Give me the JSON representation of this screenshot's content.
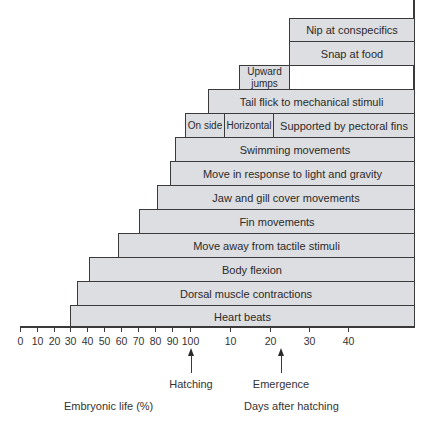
{
  "diagram": {
    "bars": [
      {
        "label": "Nip at conspecifics",
        "left": 289,
        "top": 18,
        "right": 414,
        "bottom": 41
      },
      {
        "label": "Snap at food",
        "left": 289,
        "top": 41,
        "right": 414,
        "bottom": 65
      },
      {
        "label": "Upward jumps",
        "left": 239,
        "top": 65,
        "right": 289,
        "bottom": 89,
        "small": true
      },
      {
        "label": "Tail flick to mechanical stimuli",
        "left": 208,
        "top": 89,
        "right": 414,
        "bottom": 113
      },
      {
        "label": "On side",
        "left": 185,
        "top": 113,
        "right": 224,
        "bottom": 137,
        "small": true
      },
      {
        "label": "Horizontal",
        "left": 224,
        "top": 113,
        "right": 273,
        "bottom": 137,
        "small": true
      },
      {
        "label": "Supported by pectoral fins",
        "left": 273,
        "top": 113,
        "right": 414,
        "bottom": 137
      },
      {
        "label": "Swimming movements",
        "left": 175,
        "top": 137,
        "right": 414,
        "bottom": 161
      },
      {
        "label": "Move in response to light and gravity",
        "left": 170,
        "top": 161,
        "right": 414,
        "bottom": 185
      },
      {
        "label": "Jaw and gill cover movements",
        "left": 157,
        "top": 185,
        "right": 414,
        "bottom": 209
      },
      {
        "label": "Fin movements",
        "left": 139,
        "top": 209,
        "right": 414,
        "bottom": 233
      },
      {
        "label": "Move away from tactile stimuli",
        "left": 118,
        "top": 233,
        "right": 414,
        "bottom": 257
      },
      {
        "label": "Body flexion",
        "left": 89,
        "top": 257,
        "right": 414,
        "bottom": 281
      },
      {
        "label": "Dorsal muscle contractions",
        "left": 77,
        "top": 281,
        "right": 414,
        "bottom": 305
      },
      {
        "label": "Heart beats",
        "left": 70,
        "top": 305,
        "right": 414,
        "bottom": 327
      }
    ],
    "axis": {
      "ticks": [
        {
          "label": "0",
          "x": 20
        },
        {
          "label": "10",
          "x": 37
        },
        {
          "label": "20",
          "x": 54
        },
        {
          "label": "30",
          "x": 70
        },
        {
          "label": "40",
          "x": 87
        },
        {
          "label": "50",
          "x": 104
        },
        {
          "label": "60",
          "x": 121
        },
        {
          "label": "70",
          "x": 138
        },
        {
          "label": "80",
          "x": 155
        },
        {
          "label": "90",
          "x": 172
        },
        {
          "label": "100",
          "x": 190
        },
        {
          "label": "10",
          "x": 230
        },
        {
          "label": "20",
          "x": 270
        },
        {
          "label": "30",
          "x": 309
        },
        {
          "label": "40",
          "x": 348
        }
      ],
      "embryonic_label": "Embryonic life (%)",
      "days_label": "Days after hatching"
    },
    "markers": [
      {
        "label": "Hatching",
        "x": 191
      },
      {
        "label": "Emergence",
        "x": 281
      }
    ]
  }
}
